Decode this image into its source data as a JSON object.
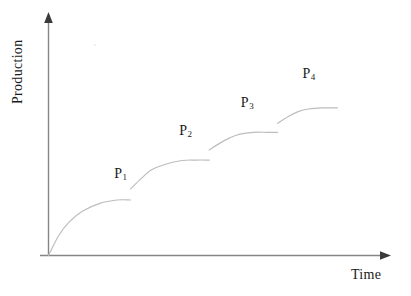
{
  "chart_data": {
    "type": "line",
    "title": "",
    "xlabel": "Time",
    "ylabel": "Production",
    "grid": false,
    "legend": null,
    "axes": {
      "x_arrow": true,
      "y_arrow": true,
      "origin_label": "",
      "x_ticks": [],
      "y_ticks": [],
      "axis_color": "#808080"
    },
    "curve_color": "#bdbdbd",
    "annotations": [
      {
        "label": "P",
        "subscript": "1",
        "text": "P1",
        "x": 0.21,
        "y": 0.36
      },
      {
        "label": "P",
        "subscript": "2",
        "text": "P2",
        "x": 0.4,
        "y": 0.55
      },
      {
        "label": "P",
        "subscript": "3",
        "text": "P3",
        "x": 0.58,
        "y": 0.68
      },
      {
        "label": "P",
        "subscript": "4",
        "text": "P4",
        "x": 0.76,
        "y": 0.81
      }
    ],
    "series": [
      {
        "name": "P1",
        "plateau_level": 0.25,
        "x_start": 0.0,
        "x_end": 0.24,
        "points": [
          [
            0.0,
            0.0
          ],
          [
            0.03,
            0.09
          ],
          [
            0.06,
            0.15
          ],
          [
            0.1,
            0.2
          ],
          [
            0.15,
            0.235
          ],
          [
            0.2,
            0.25
          ],
          [
            0.24,
            0.25
          ]
        ]
      },
      {
        "name": "P2",
        "plateau_level": 0.43,
        "x_start": 0.24,
        "x_end": 0.47,
        "points": [
          [
            0.24,
            0.3
          ],
          [
            0.27,
            0.345
          ],
          [
            0.3,
            0.385
          ],
          [
            0.34,
            0.41
          ],
          [
            0.39,
            0.428
          ],
          [
            0.43,
            0.43
          ],
          [
            0.47,
            0.43
          ]
        ]
      },
      {
        "name": "P3",
        "plateau_level": 0.555,
        "x_start": 0.47,
        "x_end": 0.67,
        "points": [
          [
            0.47,
            0.475
          ],
          [
            0.5,
            0.505
          ],
          [
            0.53,
            0.53
          ],
          [
            0.56,
            0.547
          ],
          [
            0.6,
            0.555
          ],
          [
            0.64,
            0.555
          ],
          [
            0.67,
            0.555
          ]
        ]
      },
      {
        "name": "P4",
        "plateau_level": 0.665,
        "x_start": 0.67,
        "x_end": 0.845,
        "points": [
          [
            0.67,
            0.595
          ],
          [
            0.7,
            0.625
          ],
          [
            0.73,
            0.648
          ],
          [
            0.76,
            0.66
          ],
          [
            0.8,
            0.665
          ],
          [
            0.845,
            0.665
          ]
        ]
      }
    ]
  },
  "labels": {
    "ylabel": "Production",
    "xlabel": "Time",
    "p1_base": "P",
    "p1_sub": "1",
    "p2_base": "P",
    "p2_sub": "2",
    "p3_base": "P",
    "p3_sub": "3",
    "p4_base": "P",
    "p4_sub": "4"
  }
}
